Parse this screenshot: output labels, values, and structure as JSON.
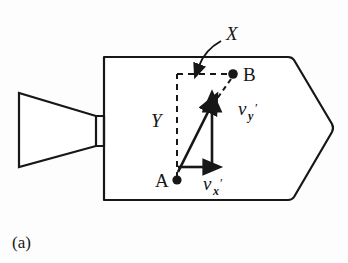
{
  "figure": {
    "caption": "(a)",
    "background_color": "#fdfdfd",
    "ink_color": "#171717",
    "labels": {
      "axis_x": "X",
      "axis_y": "Y",
      "point_a": "A",
      "point_b": "B",
      "velocity_x_base": "v",
      "velocity_x_sub": "x",
      "velocity_x_prime": "′",
      "velocity_y_base": "v",
      "velocity_y_sub": "y",
      "velocity_y_prime": "′"
    },
    "elements": [
      {
        "name": "rocket-body-outline",
        "type": "polygon-rounded"
      },
      {
        "name": "nozzle-outline",
        "type": "funnel"
      },
      {
        "name": "nozzle-neck",
        "type": "rectangle"
      },
      {
        "name": "dashed-x-axis",
        "type": "dashed-line"
      },
      {
        "name": "dashed-y-axis",
        "type": "dashed-line"
      },
      {
        "name": "dashed-resultant",
        "type": "dashed-line"
      },
      {
        "name": "vector-vx",
        "type": "arrow"
      },
      {
        "name": "vector-vy",
        "type": "arrow"
      },
      {
        "name": "vector-resultant",
        "type": "arrow"
      },
      {
        "name": "leader-arrow-x",
        "type": "curved-arrow"
      },
      {
        "name": "point-a-dot",
        "type": "dot"
      },
      {
        "name": "point-b-dot",
        "type": "dot"
      }
    ]
  }
}
